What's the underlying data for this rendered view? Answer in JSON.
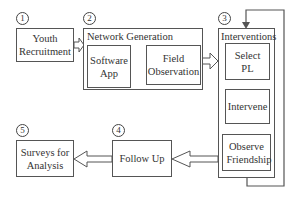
{
  "diagram": {
    "steps": [
      {
        "number": "1",
        "label": "Youth Recruitment"
      },
      {
        "number": "2",
        "label": "Network Generation",
        "substeps": [
          {
            "label": "Software App"
          },
          {
            "label": "Field Observation"
          }
        ]
      },
      {
        "number": "3",
        "label": "Interventions",
        "substeps": [
          {
            "label": "Select PL"
          },
          {
            "label": "Intervene"
          },
          {
            "label": "Observe Friendship"
          }
        ]
      },
      {
        "number": "4",
        "label": "Follow Up"
      },
      {
        "number": "5",
        "label": "Surveys for Analysis"
      }
    ],
    "colors": {
      "stroke": "#555555",
      "text": "#333333",
      "background": "#ffffff"
    }
  }
}
